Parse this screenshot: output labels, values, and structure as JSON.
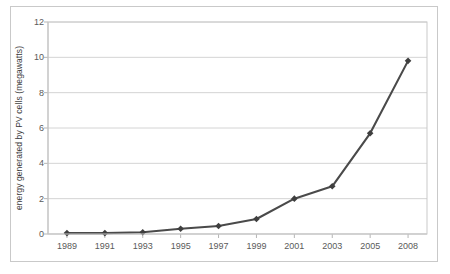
{
  "chart_data": {
    "type": "line",
    "title": "",
    "subtitle": "",
    "xlabel": "",
    "ylabel": "energy generated by PV cells (megawatts)",
    "categories": [
      "1989",
      "1991",
      "1993",
      "1995",
      "1997",
      "1999",
      "2001",
      "2003",
      "2005",
      "2008"
    ],
    "values": [
      0.05,
      0.05,
      0.1,
      0.3,
      0.45,
      0.85,
      2.0,
      2.7,
      5.7,
      9.8
    ],
    "series": [
      {
        "name": "energy generated by PV cells (megawatts)",
        "values": [
          0.05,
          0.05,
          0.1,
          0.3,
          0.45,
          0.85,
          2.0,
          2.7,
          5.7,
          9.8
        ]
      }
    ],
    "ylim": [
      0,
      12
    ],
    "yticks": [
      0,
      2,
      4,
      6,
      8,
      10,
      12
    ],
    "ytick_labels": [
      "0",
      "2",
      "4",
      "6",
      "8",
      "10",
      "12"
    ],
    "xtick_labels": [
      "1989",
      "1991",
      "1993",
      "1995",
      "1997",
      "1999",
      "2001",
      "2003",
      "2005",
      "2008"
    ],
    "grid": {
      "horizontal": true,
      "vertical": false
    },
    "legend": {
      "visible": false,
      "position": "none"
    },
    "markers": "diamond",
    "colors": {
      "line": "#4a4a4a",
      "marker": "#3f3f3f",
      "gridline": "#d4d4d4",
      "axis": "#b5b5b5",
      "plot_border": "#c9c9c9",
      "figure_border": "#c9c9c9",
      "tick_label": "#5a5a5a",
      "axis_label": "#3b3b3b",
      "background": "#ffffff"
    }
  }
}
